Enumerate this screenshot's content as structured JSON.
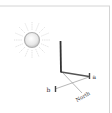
{
  "diagram": {
    "type": "sundial-gnomon-shadow",
    "labels": {
      "a": "a",
      "b": "b",
      "north": "North"
    },
    "elements": {
      "sun": "sun-icon",
      "gnomon": "vertical-stick",
      "shadow": "shadow-line",
      "north_line": "north-direction-line",
      "baseline_ab": "line-a-to-b"
    },
    "colors": {
      "border": "#d0d0d0",
      "stick": "#333333",
      "shadow": "#555555",
      "thin_line": "#9a9a9a",
      "sun_fill": "#e6e6e6",
      "sun_stroke": "#b5b5b5",
      "rays": "#d6d6d6",
      "label": "#333333"
    }
  }
}
